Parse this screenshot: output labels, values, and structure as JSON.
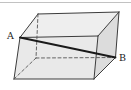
{
  "figure": {
    "divider_color": "#c2c2c2",
    "background_color": "#ffffff",
    "labels": [
      {
        "text": "A",
        "x": 10.5,
        "y": 38.5,
        "name": "vertex-label-A"
      },
      {
        "text": "B",
        "x": 122.5,
        "y": 60.5,
        "name": "vertex-label-B"
      }
    ],
    "vertices": {
      "A": [
        20,
        37.5
      ],
      "FTR": [
        98,
        36
      ],
      "FBR": [
        94,
        79
      ],
      "FBL": [
        14,
        79
      ],
      "BTL": [
        38,
        14
      ],
      "BTR": [
        119,
        12
      ],
      "BBL": [
        36,
        58
      ],
      "B": [
        115.5,
        57.5
      ]
    },
    "faces": [
      {
        "name": "face-top",
        "points": [
          "A",
          "BTL",
          "BTR",
          "FTR"
        ],
        "fill": "#eeeeee"
      },
      {
        "name": "face-right",
        "points": [
          "FTR",
          "BTR",
          "B",
          "FBR"
        ],
        "fill": "#dcdcdc"
      },
      {
        "name": "face-front",
        "points": [
          "A",
          "FTR",
          "FBR",
          "FBL"
        ],
        "fill": "#e9e9e9"
      }
    ],
    "edges": [
      {
        "name": "edge-top-left-slant",
        "from": "A",
        "to": "BTL",
        "style": "solid"
      },
      {
        "name": "edge-back-top",
        "from": "BTL",
        "to": "BTR",
        "style": "solid"
      },
      {
        "name": "edge-top-right-slant",
        "from": "BTR",
        "to": "FTR",
        "style": "solid"
      },
      {
        "name": "edge-front-top",
        "from": "A",
        "to": "FTR",
        "style": "solid"
      },
      {
        "name": "edge-front-left",
        "from": "A",
        "to": "FBL",
        "style": "solid"
      },
      {
        "name": "edge-front-bottom",
        "from": "FBL",
        "to": "FBR",
        "style": "solid"
      },
      {
        "name": "edge-front-right",
        "from": "FBR",
        "to": "FTR",
        "style": "solid"
      },
      {
        "name": "edge-back-right",
        "from": "BTR",
        "to": "B",
        "style": "solid"
      },
      {
        "name": "edge-bottom-right-slant",
        "from": "B",
        "to": "FBR",
        "style": "solid"
      },
      {
        "name": "edge-back-left-hidden",
        "from": "BTL",
        "to": "BBL",
        "style": "dashed"
      },
      {
        "name": "edge-bottom-left-hidden",
        "from": "BBL",
        "to": "FBL",
        "style": "dashed"
      },
      {
        "name": "edge-back-bottom-hidden",
        "from": "BBL",
        "to": "B",
        "style": "dashed"
      },
      {
        "name": "diagonal-ab",
        "from": "A",
        "to": "B",
        "style": "diagonal"
      }
    ],
    "stroke_colors": {
      "solid": "#3c3c3c",
      "dashed": "#555555",
      "diagonal": "#1a1a1a"
    }
  }
}
